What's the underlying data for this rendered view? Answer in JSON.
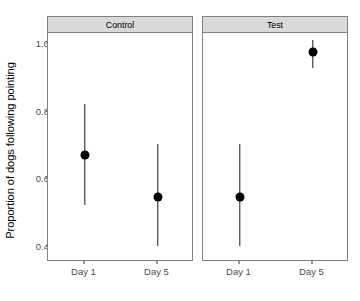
{
  "chart_data": {
    "type": "scatter",
    "title": "",
    "xlabel": "",
    "ylabel": "Proportion of dogs following pointing",
    "ylim": [
      0.355,
      1.03
    ],
    "yticks": [
      0.4,
      0.6,
      0.8,
      1.0
    ],
    "ytick_labels": [
      "0.4",
      "0.6",
      "0.8",
      "1.0"
    ],
    "categories": [
      "Day 1",
      "Day 5"
    ],
    "grid": false,
    "legend": "none",
    "facet_variable": "group",
    "facets": [
      {
        "label": "Control",
        "points": [
          {
            "x": "Day 1",
            "value": 0.67,
            "ci_low": 0.52,
            "ci_high": 0.82
          },
          {
            "x": "Day 5",
            "value": 0.545,
            "ci_low": 0.4,
            "ci_high": 0.7
          }
        ]
      },
      {
        "label": "Test",
        "points": [
          {
            "x": "Day 1",
            "value": 0.545,
            "ci_low": 0.4,
            "ci_high": 0.7
          },
          {
            "x": "Day 5",
            "value": 0.973,
            "ci_low": 0.925,
            "ci_high": 1.01
          }
        ]
      }
    ],
    "colors": {
      "point": "#000000",
      "errorbar": "#1a1a1a",
      "panel_strip_bg": "#d9d9d9",
      "panel_border": "#808080",
      "axis_text": "#4d4d4d",
      "background": "#ffffff"
    }
  },
  "axis": {
    "y_title": "Proportion of dogs following pointing"
  }
}
